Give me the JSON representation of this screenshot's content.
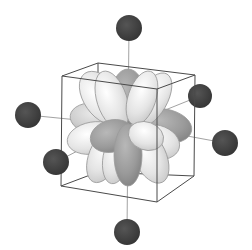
{
  "diagram": {
    "center": [
      128,
      125
    ],
    "colors": {
      "ligand": "#3f3f3f",
      "axis_line": "#8a8a8a",
      "cube_edge": "#4a4a4a",
      "lobe_light": "#f2f2f2",
      "lobe_mid": "#c9c9c9",
      "lobe_dark": "#8f8f8f",
      "lobe_outline": "#9a9a9a"
    },
    "ligands": [
      {
        "name": "top",
        "cx": 129,
        "cy": 28,
        "r": 13
      },
      {
        "name": "bottom",
        "cx": 127,
        "cy": 232,
        "r": 13
      },
      {
        "name": "left",
        "cx": 28,
        "cy": 115,
        "r": 13
      },
      {
        "name": "right",
        "cx": 225,
        "cy": 143,
        "r": 13
      },
      {
        "name": "back-right",
        "cx": 200,
        "cy": 96,
        "r": 12
      },
      {
        "name": "front-left",
        "cx": 56,
        "cy": 162,
        "r": 13
      }
    ],
    "cube": {
      "top": [
        [
          98,
          63
        ],
        [
          195,
          75
        ],
        [
          157,
          89
        ],
        [
          62,
          76
        ]
      ],
      "bottom": [
        [
          98,
          172
        ],
        [
          194,
          176
        ],
        [
          157,
          202
        ],
        [
          61,
          186
        ]
      ]
    }
  }
}
